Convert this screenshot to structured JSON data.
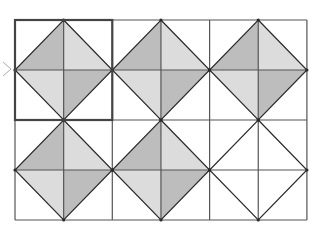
{
  "diagram": {
    "grid": {
      "columns": 3,
      "rows": 2,
      "left": 15,
      "top": 20,
      "cell_width": 97.3,
      "cell_height": 100,
      "subdivisions": 2
    },
    "colors": {
      "line": "#2a2a2a",
      "grid_line": "#555555",
      "highlight_border": "#444444",
      "dark_shade": "#bdbdbd",
      "light_shade": "#dcdcdc",
      "background": "#ffffff",
      "arrow": "#aaaaaa"
    },
    "highlighted_tile": {
      "row": 0,
      "col": 0
    },
    "tiles": [
      {
        "row": 0,
        "col": 0,
        "shaded": true
      },
      {
        "row": 0,
        "col": 1,
        "shaded": true
      },
      {
        "row": 0,
        "col": 2,
        "shaded": true
      },
      {
        "row": 1,
        "col": 0,
        "shaded": true
      },
      {
        "row": 1,
        "col": 1,
        "shaded": true
      },
      {
        "row": 1,
        "col": 2,
        "shaded": false
      }
    ],
    "triangle_shading": {
      "top_left": "dark",
      "top_right": "light",
      "bottom_left": "light",
      "bottom_right": "dark"
    },
    "left_marker": "arrow-pointer"
  }
}
